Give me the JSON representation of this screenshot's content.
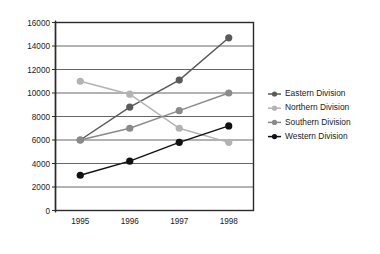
{
  "chart_data": {
    "type": "line",
    "title": "",
    "xlabel": "",
    "ylabel": "",
    "categories": [
      "1995",
      "1996",
      "1997",
      "1998"
    ],
    "yticks": [
      0,
      2000,
      4000,
      6000,
      8000,
      10000,
      12000,
      14000,
      16000
    ],
    "ylim": [
      0,
      16000
    ],
    "grid": "horizontal",
    "legend_position": "right",
    "series": [
      {
        "name": "Eastern Division",
        "color": "#5a5a5a",
        "values": [
          6000,
          8800,
          11100,
          14700
        ]
      },
      {
        "name": "Northern Division",
        "color": "#b3b3b3",
        "values": [
          11000,
          9900,
          7000,
          5800
        ]
      },
      {
        "name": "Southern Division",
        "color": "#8a8a8a",
        "values": [
          6000,
          7000,
          8500,
          10000
        ]
      },
      {
        "name": "Western Division",
        "color": "#111111",
        "values": [
          3000,
          4200,
          5800,
          7200
        ]
      }
    ]
  }
}
